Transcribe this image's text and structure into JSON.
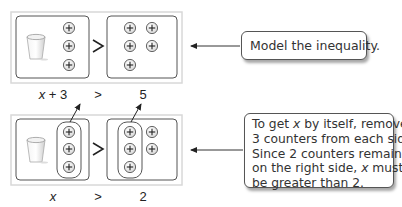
{
  "top_model": {
    "callout": "Model the inequality.",
    "left_box": {
      "cup": "cup-icon",
      "counters": 3
    },
    "relation": ">",
    "right_box": {
      "counters": 5
    },
    "expression": {
      "left_var": "x",
      "left_rest": " + 3",
      "relation": ">",
      "right": "5"
    }
  },
  "bottom_model": {
    "callout_lines": [
      [
        "To get ",
        "x",
        " by itself, remove"
      ],
      [
        "3 counters from each side."
      ],
      [
        "Since 2 counters remain"
      ],
      [
        "on the right side, ",
        "x",
        " must"
      ],
      [
        "be greater than 2."
      ]
    ],
    "left_box": {
      "cup": "cup-icon",
      "counters": 3,
      "removed": 3
    },
    "relation": ">",
    "right_box": {
      "counters": 5,
      "removed": 3
    },
    "expression": {
      "left_var": "x",
      "relation": ">",
      "right": "2"
    }
  },
  "colors": {
    "box_border": "#555555",
    "frame": "#d8d8d8",
    "counter_fill": "#eeeeee",
    "counter_stroke": "#444444",
    "arrow": "#333333"
  }
}
